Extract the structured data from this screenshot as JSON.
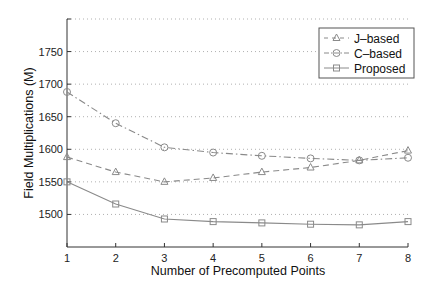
{
  "chart_data": {
    "type": "line",
    "title": "",
    "xlabel": "Number of Precomputed Points",
    "ylabel": "Field Multiplications (M)",
    "x": [
      1,
      2,
      3,
      4,
      5,
      6,
      7,
      8
    ],
    "xlim": [
      1,
      8
    ],
    "ylim": [
      1450,
      1800
    ],
    "xticks": [
      1,
      2,
      3,
      4,
      5,
      6,
      7,
      8
    ],
    "yticks": [
      1500,
      1550,
      1600,
      1650,
      1700,
      1750
    ],
    "grid": "horizontal-dotted",
    "legend_position": "upper right",
    "series": [
      {
        "name": "J–based",
        "marker": "triangle",
        "linestyle": "dashed",
        "values": [
          1588,
          1565,
          1550,
          1556,
          1565,
          1572,
          1583,
          1598
        ]
      },
      {
        "name": "C–based",
        "marker": "circle",
        "linestyle": "dashdot",
        "values": [
          1688,
          1640,
          1603,
          1595,
          1590,
          1586,
          1583,
          1587
        ]
      },
      {
        "name": "Proposed",
        "marker": "square",
        "linestyle": "solid",
        "values": [
          1550,
          1516,
          1493,
          1489,
          1487,
          1485,
          1484,
          1489
        ]
      }
    ]
  },
  "colors": {
    "line": "#8a8a8a",
    "axis": "#333333",
    "grid": "#b0b0b0",
    "text": "#111111"
  }
}
